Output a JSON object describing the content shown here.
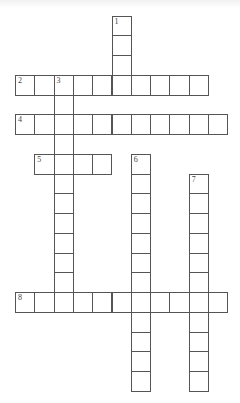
{
  "puzzle": {
    "type": "crossword",
    "grid": {
      "origin_x": 15,
      "origin_y": 15.5,
      "cell_w": 19.3,
      "cell_h": 19.75,
      "line_color": "#555555"
    },
    "entries": [
      {
        "number": "1",
        "direction": "down",
        "row": 0,
        "col": 5,
        "length": 4
      },
      {
        "number": "2",
        "direction": "across",
        "row": 3,
        "col": 0,
        "length": 10
      },
      {
        "number": "3",
        "direction": "down",
        "row": 3,
        "col": 2,
        "length": 12
      },
      {
        "number": "4",
        "direction": "across",
        "row": 5,
        "col": 0,
        "length": 11
      },
      {
        "number": "5",
        "direction": "across",
        "row": 7,
        "col": 1,
        "length": 4
      },
      {
        "number": "6",
        "direction": "down",
        "row": 7,
        "col": 6,
        "length": 12
      },
      {
        "number": "7",
        "direction": "down",
        "row": 8,
        "col": 9,
        "length": 11
      },
      {
        "number": "8",
        "direction": "across",
        "row": 14,
        "col": 0,
        "length": 11
      }
    ]
  }
}
